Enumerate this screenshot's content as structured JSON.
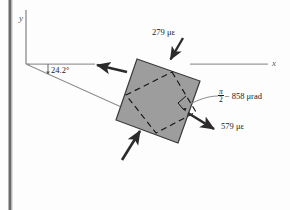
{
  "figure": {
    "axes": {
      "y_label": "y",
      "x_label": "x"
    },
    "angle": {
      "value": "24.2°",
      "name": "principal-axis-angle"
    },
    "strains": {
      "top": "279 με",
      "right": "579 με",
      "shear_numerator": "π",
      "shear_denominator": "2",
      "shear_rest": "− 858 μrad"
    },
    "colors": {
      "element_fill": "#9d9d9d",
      "element_stroke": "#3a3a3a",
      "dashed_stroke": "#1a1a1a",
      "axis_stroke": "#8c8c8c",
      "arrow_fill": "#2b2b2b",
      "page_edge": "#5e5e5e",
      "text": "#1a1a1a"
    }
  }
}
